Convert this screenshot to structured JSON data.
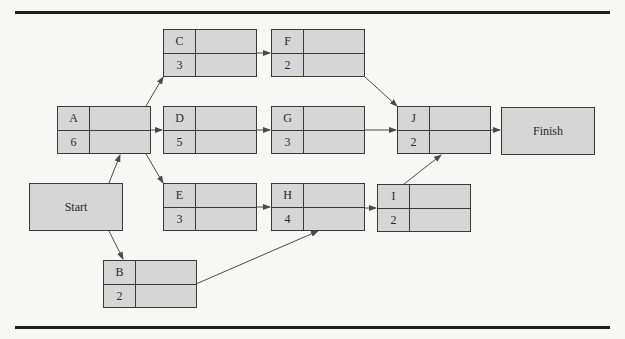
{
  "diagram": {
    "type": "activity-on-node network",
    "colors": {
      "node_fill": "#d6d6d6",
      "border": "#3a3a3a",
      "rule": "#1e1e1e",
      "background": "#f7f7f5"
    },
    "terminals": {
      "start": {
        "label": "Start"
      },
      "finish": {
        "label": "Finish"
      }
    },
    "activities": {
      "A": {
        "id": "A",
        "duration": "6"
      },
      "B": {
        "id": "B",
        "duration": "2"
      },
      "C": {
        "id": "C",
        "duration": "3"
      },
      "D": {
        "id": "D",
        "duration": "5"
      },
      "E": {
        "id": "E",
        "duration": "3"
      },
      "F": {
        "id": "F",
        "duration": "2"
      },
      "G": {
        "id": "G",
        "duration": "3"
      },
      "H": {
        "id": "H",
        "duration": "4"
      },
      "I": {
        "id": "I",
        "duration": "2"
      },
      "J": {
        "id": "J",
        "duration": "2"
      }
    },
    "edges": [
      [
        "Start",
        "A"
      ],
      [
        "Start",
        "B"
      ],
      [
        "A",
        "C"
      ],
      [
        "A",
        "D"
      ],
      [
        "A",
        "E"
      ],
      [
        "C",
        "F"
      ],
      [
        "D",
        "G"
      ],
      [
        "E",
        "H"
      ],
      [
        "B",
        "H"
      ],
      [
        "H",
        "I"
      ],
      [
        "F",
        "J"
      ],
      [
        "G",
        "J"
      ],
      [
        "I",
        "J"
      ],
      [
        "J",
        "Finish"
      ]
    ]
  }
}
